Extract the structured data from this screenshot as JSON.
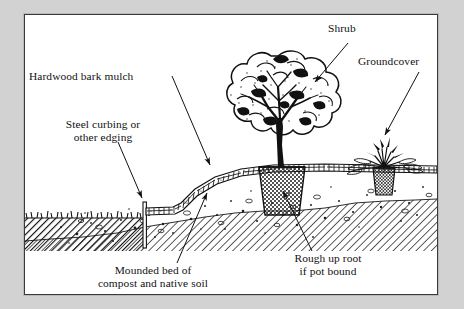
{
  "figure": {
    "type": "line-art-diagram",
    "frame_background": "#ffffff",
    "page_background": "#d2d2d2",
    "ink_color": "#111111"
  },
  "labels": {
    "hardwood_mulch": "Hardwood bark mulch",
    "steel_curbing_line1": "Steel curbing or",
    "steel_curbing_line2": "other edging",
    "shrub": "Shrub",
    "groundcover": "Groundcover",
    "mounded_bed_line1": "Mounded bed of",
    "mounded_bed_line2": "compost and native soil",
    "rough_root_line1": "Rough up root",
    "rough_root_line2": "if pot bound"
  },
  "elements": {
    "shrub_name": "shrub-illustration",
    "groundcover_name": "groundcover-illustration",
    "root_ball_name": "shrub-root-ball",
    "groundcover_root_ball_name": "groundcover-root-ball",
    "mulch_layer_name": "mulch-layer",
    "mound_soil_name": "mounded-soil-body",
    "subsoil_name": "subsoil-hatch-band",
    "turf_name": "turf-block",
    "edging_name": "steel-edging-strip"
  },
  "leader_arrows": [
    {
      "name": "arrow-hardwood-mulch",
      "from": "Hardwood bark mulch",
      "to": "mulch layer on mound slope"
    },
    {
      "name": "arrow-steel-curbing",
      "from": "Steel curbing or other edging",
      "to": "edging strip"
    },
    {
      "name": "arrow-shrub",
      "from": "Shrub",
      "to": "shrub canopy"
    },
    {
      "name": "arrow-groundcover",
      "from": "Groundcover",
      "to": "groundcover plant"
    },
    {
      "name": "arrow-mounded-bed",
      "from": "Mounded bed of compost and native soil",
      "to": "mound interior"
    },
    {
      "name": "arrow-rough-up-root",
      "from": "Rough up root if pot bound",
      "to": "shrub root ball"
    }
  ]
}
